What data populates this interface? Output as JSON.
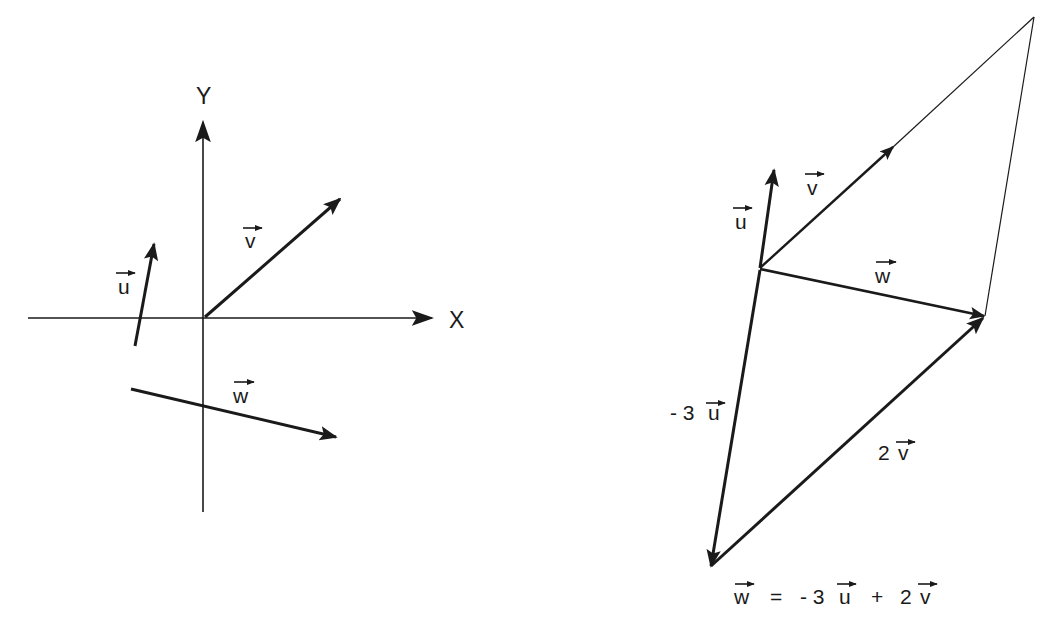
{
  "left_diagram": {
    "axis_x_label": "X",
    "axis_y_label": "Y",
    "vector_u_label": "u",
    "vector_v_label": "v",
    "vector_w_label": "w"
  },
  "right_diagram": {
    "vector_u_label": "u",
    "vector_v_label": "v",
    "vector_w_label": "w",
    "minus_three_u_label": {
      "coef": "- 3",
      "vec": "u"
    },
    "two_v_label": {
      "coef": "2",
      "vec": "v"
    },
    "equation": {
      "lhs": "w",
      "eq": "=",
      "term1_coef": "- 3",
      "term1_vec": "u",
      "plus": "+",
      "term2_coef": "2",
      "term2_vec": "v"
    }
  },
  "colors": {
    "ink": "#1a1a1a",
    "background": "#ffffff"
  }
}
